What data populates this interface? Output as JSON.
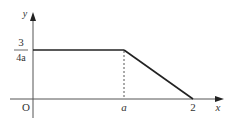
{
  "diagram": {
    "type": "piecewise-function-graph",
    "axes": {
      "x_label": "x",
      "y_label": "y",
      "origin_label": "O"
    },
    "y_value": {
      "numerator": "3",
      "denominator": "4a"
    },
    "x_ticks": [
      {
        "label": "a"
      },
      {
        "label": "2"
      }
    ],
    "segments": [
      {
        "from": [
          "0",
          "3/(4a)"
        ],
        "to": [
          "a",
          "3/(4a)"
        ],
        "style": "solid"
      },
      {
        "from": [
          "a",
          "3/(4a)"
        ],
        "to": [
          "2",
          "0"
        ],
        "style": "solid"
      },
      {
        "from": [
          "a",
          "0"
        ],
        "to": [
          "a",
          "3/(4a)"
        ],
        "style": "dashed"
      }
    ],
    "colors": {
      "axis": "#555555",
      "curve": "#222222",
      "text": "#333333"
    }
  }
}
